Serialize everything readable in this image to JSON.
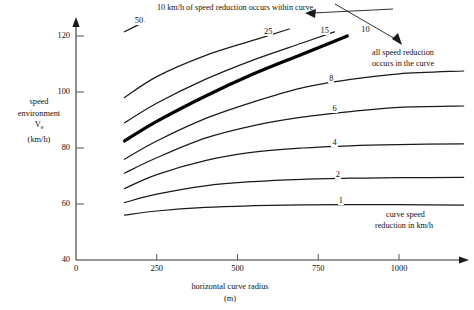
{
  "chart_data": {
    "type": "line",
    "title": "10 km/h of speed reduction occurs within curve",
    "xlabel": "horizontal curve radius",
    "xunit": "(m)",
    "ylabel_lines": [
      "speed",
      "environment",
      "V",
      "(km/h)"
    ],
    "ylabel_subscript": "e",
    "xlim": [
      0,
      1200
    ],
    "ylim": [
      40,
      125
    ],
    "xticks": [
      0,
      250,
      500,
      750,
      1000
    ],
    "xticklabels": [
      "0",
      "250",
      "500",
      "750",
      "1000"
    ],
    "yticks": [
      40,
      60,
      80,
      100,
      120
    ],
    "yticklabels": [
      "40",
      "60",
      "80",
      "100",
      "120"
    ],
    "grid": false,
    "legend": "none",
    "legend_note": "curve speed reduction in km/h",
    "annotations": [
      {
        "name": "within-curve-note",
        "text": "10 km/h of speed reduction occurs within curve",
        "target": "10 curve"
      },
      {
        "name": "all-reduction-note",
        "text_lines": [
          "all speed reduction",
          "occurs in the curve"
        ],
        "target": "upper region"
      }
    ],
    "series": [
      {
        "name": "50",
        "label": "50",
        "emphasis": false,
        "points": [
          [
            150,
            121.5
          ],
          [
            210,
            125.0
          ]
        ]
      },
      {
        "name": "25",
        "label": "25",
        "emphasis": false,
        "points": [
          [
            150,
            98.0
          ],
          [
            250,
            105.5
          ],
          [
            400,
            113.0
          ],
          [
            550,
            118.5
          ],
          [
            660,
            122.5
          ]
        ]
      },
      {
        "name": "15",
        "label": "15",
        "emphasis": false,
        "points": [
          [
            150,
            89.0
          ],
          [
            250,
            96.0
          ],
          [
            400,
            104.5
          ],
          [
            550,
            111.5
          ],
          [
            700,
            117.5
          ],
          [
            800,
            121.5
          ]
        ]
      },
      {
        "name": "10",
        "label": "10",
        "emphasis": true,
        "points": [
          [
            150,
            82.5
          ],
          [
            250,
            89.5
          ],
          [
            400,
            98.5
          ],
          [
            550,
            106.5
          ],
          [
            700,
            113.5
          ],
          [
            840,
            120.0
          ]
        ]
      },
      {
        "name": "8",
        "label": "8",
        "emphasis": false,
        "points": [
          [
            150,
            76.0
          ],
          [
            250,
            82.5
          ],
          [
            400,
            90.5
          ],
          [
            550,
            96.5
          ],
          [
            700,
            101.5
          ],
          [
            850,
            104.5
          ],
          [
            1000,
            106.5
          ],
          [
            1200,
            107.5
          ]
        ]
      },
      {
        "name": "6",
        "label": "6",
        "emphasis": false,
        "points": [
          [
            150,
            71.0
          ],
          [
            250,
            76.5
          ],
          [
            400,
            83.5
          ],
          [
            550,
            88.0
          ],
          [
            700,
            91.0
          ],
          [
            850,
            93.0
          ],
          [
            1000,
            94.5
          ],
          [
            1200,
            95.0
          ]
        ]
      },
      {
        "name": "4",
        "label": "4",
        "emphasis": false,
        "points": [
          [
            150,
            65.5
          ],
          [
            250,
            70.5
          ],
          [
            400,
            75.5
          ],
          [
            550,
            78.5
          ],
          [
            700,
            80.0
          ],
          [
            850,
            80.8
          ],
          [
            1000,
            81.2
          ],
          [
            1200,
            81.5
          ]
        ]
      },
      {
        "name": "2",
        "label": "2",
        "emphasis": false,
        "points": [
          [
            150,
            60.5
          ],
          [
            250,
            63.5
          ],
          [
            400,
            66.5
          ],
          [
            550,
            68.0
          ],
          [
            700,
            68.8
          ],
          [
            850,
            69.2
          ],
          [
            1000,
            69.4
          ],
          [
            1200,
            69.5
          ]
        ]
      },
      {
        "name": "1",
        "label": "1",
        "emphasis": false,
        "points": [
          [
            150,
            56.0
          ],
          [
            250,
            57.5
          ],
          [
            400,
            58.8
          ],
          [
            550,
            59.4
          ],
          [
            700,
            59.7
          ],
          [
            850,
            59.8
          ],
          [
            1000,
            59.8
          ],
          [
            1200,
            59.6
          ]
        ]
      }
    ]
  },
  "colors": {
    "curve": "#1a1a1a",
    "emphasis_curve": "#000000",
    "axis": "#333333",
    "background": "#ffffff"
  }
}
